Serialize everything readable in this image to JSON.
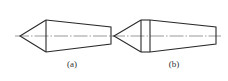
{
  "figures": [
    {
      "id": "a",
      "label": "(a)",
      "description": "cone tip joined to tapered frustum, single shoulder line",
      "geometry": {
        "tip": [
          20,
          36
        ],
        "shoulder_x": [
          46
        ],
        "shoulder_y": [
          20,
          52
        ],
        "end_x": 111,
        "end_y": [
          27,
          44
        ],
        "centerline_x": [
          15,
          115
        ]
      }
    },
    {
      "id": "b",
      "label": "(b)",
      "description": "cone tip joined to cylindrical band then tapered frustum, double shoulder line",
      "geometry": {
        "tip": [
          114,
          36
        ],
        "shoulder_x": [
          141,
          150
        ],
        "shoulder_y": [
          20,
          52
        ],
        "end_x": 216,
        "end_y": [
          27,
          44
        ],
        "centerline_x": [
          111,
          221
        ]
      }
    }
  ],
  "colors": {
    "line": "#2a2a2a",
    "centerline": "#555555",
    "background": "#ffffff"
  }
}
